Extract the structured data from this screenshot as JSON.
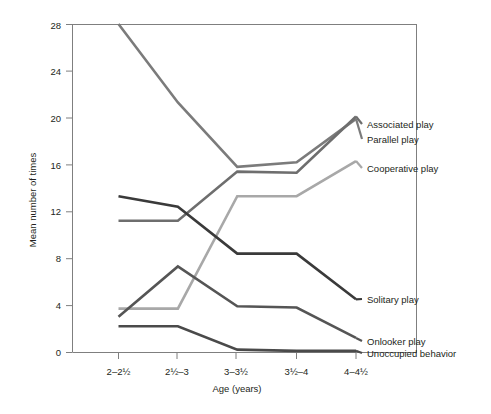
{
  "chart_data": {
    "type": "line",
    "title": "",
    "xlabel": "Age (years)",
    "ylabel": "Mean number of times",
    "categories": [
      "2–2½",
      "2½–3",
      "3–3½",
      "3½–4",
      "4–4½"
    ],
    "ylim": [
      0,
      28
    ],
    "yticks": [
      0,
      4,
      8,
      12,
      16,
      20,
      24,
      28
    ],
    "ytick_labels": [
      "0",
      "4",
      "8",
      "12",
      "16",
      "20",
      "24",
      "28"
    ],
    "grid": false,
    "legend_position": "right-inline-labels",
    "series": [
      {
        "name": "Parallel play",
        "color": "#7b7b7b",
        "values": [
          28.0,
          21.3,
          15.8,
          16.2,
          19.9
        ]
      },
      {
        "name": "Associated play",
        "color": "#6e6e6e",
        "values": [
          11.2,
          11.2,
          15.4,
          15.3,
          20.1
        ]
      },
      {
        "name": "Cooperative play",
        "color": "#a8a8a8",
        "values": [
          3.7,
          3.7,
          13.3,
          13.3,
          16.3
        ]
      },
      {
        "name": "Solitary play",
        "color": "#3a3a3a",
        "values": [
          13.3,
          12.4,
          8.4,
          8.4,
          4.5
        ]
      },
      {
        "name": "Onlooker play",
        "color": "#555555",
        "values": [
          3.0,
          7.3,
          3.9,
          3.8,
          1.2
        ]
      },
      {
        "name": "Unoccupied behavior",
        "color": "#4a4a4a",
        "values": [
          2.2,
          2.2,
          0.2,
          0.1,
          0.1
        ]
      }
    ],
    "annotations": [
      {
        "text": "Associated play",
        "series": "Associated play"
      },
      {
        "text": "Parallel play",
        "series": "Parallel play"
      },
      {
        "text": "Cooperative play",
        "series": "Cooperative play"
      },
      {
        "text": "Solitary play",
        "series": "Solitary play"
      },
      {
        "text": "Onlooker play",
        "series": "Onlooker play"
      },
      {
        "text": "Unoccupied behavior",
        "series": "Unoccupied behavior"
      }
    ]
  },
  "labels": {
    "y_axis_title": "Mean number of times",
    "x_axis_title": "Age (years)",
    "x_tick_0": "2–2½",
    "x_tick_1": "2½–3",
    "x_tick_2": "3–3½",
    "x_tick_3": "3½–4",
    "x_tick_4": "4–4½",
    "y_tick_0": "0",
    "y_tick_1": "4",
    "y_tick_2": "8",
    "y_tick_3": "12",
    "y_tick_4": "16",
    "y_tick_5": "20",
    "y_tick_6": "24",
    "y_tick_7": "28",
    "legend_associated": "Associated play",
    "legend_parallel": "Parallel play",
    "legend_cooperative": "Cooperative play",
    "legend_solitary": "Solitary play",
    "legend_onlooker": "Onlooker play",
    "legend_unoccupied": "Unoccupied behavior"
  }
}
